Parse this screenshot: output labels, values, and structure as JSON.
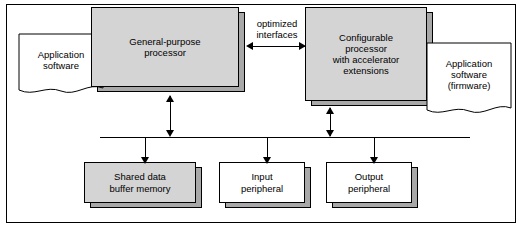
{
  "diagram": {
    "blocks": {
      "app_software_left": "Application\nsoftware",
      "gp_processor": "General-purpose\nprocessor",
      "configurable_processor": "Configurable\nprocessor\nwith accelerator\nextensions",
      "app_software_right": "Application\nsoftware\n(firmware)",
      "shared_buffer": "Shared data\nbuffer memory",
      "input_peripheral": "Input\nperipheral",
      "output_peripheral": "Output\nperipheral"
    },
    "captions": {
      "optimized_interfaces": "optimized\ninterfaces"
    },
    "colors": {
      "block_fill_gray": "#d4d4d4",
      "block_fill_white": "#ffffff",
      "shadow": "#a8a8a8",
      "stroke": "#000000",
      "background": "#ffffff"
    }
  }
}
